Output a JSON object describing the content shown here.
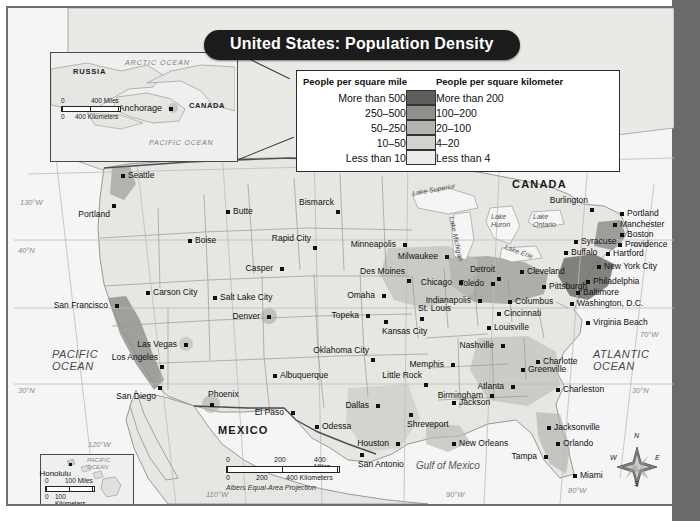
{
  "title": "United States: Population Density",
  "legend": {
    "header_miles": "People per square mile",
    "header_km": "People per square kilometer",
    "rows": [
      {
        "miles": "More than 500",
        "km": "More than 200",
        "color": "#5e5e5b"
      },
      {
        "miles": "250–500",
        "km": "100–200",
        "color": "#8f8f8b"
      },
      {
        "miles": "50–250",
        "km": "20–100",
        "color": "#b2b2ae"
      },
      {
        "miles": "10–50",
        "km": "4–20",
        "color": "#d2d2ce"
      },
      {
        "miles": "Less than 10",
        "km": "Less than 4",
        "color": "#ececea"
      }
    ]
  },
  "insets": {
    "alaska": {
      "labels": [
        "RUSSIA",
        "ARCTIC  OCEAN",
        "CANADA",
        "PACIFIC OCEAN"
      ],
      "city": "Anchorage",
      "scale_miles_0": "0",
      "scale_miles_max": "400 Miles",
      "scale_km_0": "0",
      "scale_km_max": "400 Kilometers"
    },
    "hawaii": {
      "labels": [
        "PACIFIC OCEAN"
      ],
      "city": "Honolulu",
      "scale_miles_0": "0",
      "scale_miles_max": "100 Miles",
      "scale_km_0": "0",
      "scale_km_max": "100 Kilometers"
    }
  },
  "scale": {
    "miles": [
      "0",
      "200",
      "400 Miles"
    ],
    "km": [
      "0",
      "200",
      "400 Kilometers"
    ],
    "projection": "Albers Equal-Area Projection"
  },
  "compass": {
    "n": "N",
    "e": "E",
    "s": "S",
    "w": "W"
  },
  "map_labels": {
    "countries": [
      {
        "name": "CANADA",
        "x": 510,
        "y": 175
      },
      {
        "name": "MEXICO",
        "x": 218,
        "y": 422
      }
    ],
    "oceans": [
      {
        "name": "PACIFIC",
        "sub": "OCEAN",
        "x": 50,
        "y": 348
      },
      {
        "name": "ATLANTIC",
        "sub": "OCEAN",
        "x": 592,
        "y": 348
      },
      {
        "name": "Gulf of Mexico",
        "x": 418,
        "y": 460
      }
    ],
    "lakes": [
      {
        "name": "Lake Superior",
        "x": 420,
        "y": 182
      },
      {
        "name": "Lake Michigan",
        "x": 455,
        "y": 215
      },
      {
        "name": "Lake Huron",
        "x": 493,
        "y": 212
      },
      {
        "name": "Lake Ontario",
        "x": 536,
        "y": 212
      },
      {
        "name": "Lake Erie",
        "x": 508,
        "y": 243
      }
    ],
    "graticules": [
      {
        "name": "130°W",
        "x": 12,
        "y": 190
      },
      {
        "name": "120°W",
        "x": 88,
        "y": 435
      },
      {
        "name": "110°W",
        "x": 203,
        "y": 487
      },
      {
        "name": "90°W",
        "x": 443,
        "y": 490
      },
      {
        "name": "80°W",
        "x": 565,
        "y": 486
      },
      {
        "name": "70°W",
        "x": 643,
        "y": 330
      },
      {
        "name": "40°N",
        "x": 12,
        "y": 243
      },
      {
        "name": "40°N",
        "x": 637,
        "y": 243
      },
      {
        "name": "30°N",
        "x": 14,
        "y": 384
      },
      {
        "name": "30°N",
        "x": 637,
        "y": 384
      }
    ]
  },
  "cities": [
    {
      "name": "Seattle",
      "x": 113,
      "y": 166,
      "pos": "r"
    },
    {
      "name": "Portland",
      "x": 104,
      "y": 196,
      "pos": "bl"
    },
    {
      "name": "Boise",
      "x": 180,
      "y": 231,
      "pos": "r"
    },
    {
      "name": "Butte",
      "x": 218,
      "y": 202,
      "pos": "r"
    },
    {
      "name": "Casper",
      "x": 272,
      "y": 259,
      "pos": "l"
    },
    {
      "name": "Bismarck",
      "x": 328,
      "y": 202,
      "pos": "al"
    },
    {
      "name": "Rapid City",
      "x": 305,
      "y": 238,
      "pos": "al"
    },
    {
      "name": "Minneapolis",
      "x": 395,
      "y": 235,
      "pos": "l"
    },
    {
      "name": "Milwaukee",
      "x": 437,
      "y": 247,
      "pos": "l"
    },
    {
      "name": "Des Moines",
      "x": 399,
      "y": 271,
      "pos": "al"
    },
    {
      "name": "Omaha",
      "x": 374,
      "y": 286,
      "pos": "l"
    },
    {
      "name": "Chicago",
      "x": 451,
      "y": 273,
      "pos": "l"
    },
    {
      "name": "Topeka",
      "x": 358,
      "y": 306,
      "pos": "l"
    },
    {
      "name": "Kansas City",
      "x": 376,
      "y": 312,
      "pos": "b"
    },
    {
      "name": "St. Louis",
      "x": 412,
      "y": 309,
      "pos": "a"
    },
    {
      "name": "Indianapolis",
      "x": 470,
      "y": 291,
      "pos": "l"
    },
    {
      "name": "Detroit",
      "x": 489,
      "y": 269,
      "pos": "al"
    },
    {
      "name": "Toledo",
      "x": 483,
      "y": 274,
      "pos": "l"
    },
    {
      "name": "Columbus",
      "x": 500,
      "y": 292,
      "pos": "r"
    },
    {
      "name": "Cincinnati",
      "x": 489,
      "y": 304,
      "pos": "r"
    },
    {
      "name": "Cleveland",
      "x": 512,
      "y": 262,
      "pos": "r"
    },
    {
      "name": "Louisville",
      "x": 479,
      "y": 318,
      "pos": "r"
    },
    {
      "name": "Pittsburgh",
      "x": 534,
      "y": 277,
      "pos": "r"
    },
    {
      "name": "Buffalo",
      "x": 556,
      "y": 243,
      "pos": "r"
    },
    {
      "name": "Syracuse",
      "x": 566,
      "y": 232,
      "pos": "r"
    },
    {
      "name": "Burlington",
      "x": 582,
      "y": 200,
      "pos": "al"
    },
    {
      "name": "Portland",
      "x": 612,
      "y": 204,
      "pos": "r"
    },
    {
      "name": "Manchester",
      "x": 605,
      "y": 215,
      "pos": "r"
    },
    {
      "name": "Boston",
      "x": 612,
      "y": 225,
      "pos": "r"
    },
    {
      "name": "Providence",
      "x": 610,
      "y": 235,
      "pos": "r"
    },
    {
      "name": "Hartford",
      "x": 598,
      "y": 244,
      "pos": "r"
    },
    {
      "name": "New York City",
      "x": 589,
      "y": 257,
      "pos": "r"
    },
    {
      "name": "Philadelphia",
      "x": 578,
      "y": 272,
      "pos": "r"
    },
    {
      "name": "Baltimore",
      "x": 568,
      "y": 283,
      "pos": "r"
    },
    {
      "name": "Washington, D.C.",
      "x": 562,
      "y": 294,
      "pos": "r"
    },
    {
      "name": "Virginia Beach",
      "x": 578,
      "y": 313,
      "pos": "r"
    },
    {
      "name": "Charlotte",
      "x": 528,
      "y": 352,
      "pos": "r"
    },
    {
      "name": "Greenville",
      "x": 513,
      "y": 360,
      "pos": "r"
    },
    {
      "name": "Nashville",
      "x": 493,
      "y": 336,
      "pos": "l"
    },
    {
      "name": "Memphis",
      "x": 443,
      "y": 355,
      "pos": "l"
    },
    {
      "name": "Atlanta",
      "x": 503,
      "y": 377,
      "pos": "l"
    },
    {
      "name": "Birmingham",
      "x": 482,
      "y": 386,
      "pos": "l"
    },
    {
      "name": "Charleston",
      "x": 548,
      "y": 380,
      "pos": "r"
    },
    {
      "name": "Jackson",
      "x": 444,
      "y": 393,
      "pos": "r"
    },
    {
      "name": "Little Rock",
      "x": 416,
      "y": 375,
      "pos": "al"
    },
    {
      "name": "Shreveport",
      "x": 401,
      "y": 405,
      "pos": "b"
    },
    {
      "name": "Dallas",
      "x": 368,
      "y": 396,
      "pos": "l"
    },
    {
      "name": "Houston",
      "x": 388,
      "y": 434,
      "pos": "l"
    },
    {
      "name": "San Antonio",
      "x": 352,
      "y": 445,
      "pos": "b"
    },
    {
      "name": "New Orleans",
      "x": 444,
      "y": 434,
      "pos": "r"
    },
    {
      "name": "Jacksonville",
      "x": 539,
      "y": 418,
      "pos": "r"
    },
    {
      "name": "Orlando",
      "x": 548,
      "y": 434,
      "pos": "r"
    },
    {
      "name": "Tampa",
      "x": 536,
      "y": 447,
      "pos": "l"
    },
    {
      "name": "Miami",
      "x": 565,
      "y": 466,
      "pos": "r"
    },
    {
      "name": "Odessa",
      "x": 307,
      "y": 417,
      "pos": "r"
    },
    {
      "name": "El Paso",
      "x": 283,
      "y": 403,
      "pos": "l"
    },
    {
      "name": "Albuquerque",
      "x": 265,
      "y": 366,
      "pos": "r"
    },
    {
      "name": "Oklahoma City",
      "x": 363,
      "y": 350,
      "pos": "al"
    },
    {
      "name": "Phoenix",
      "x": 202,
      "y": 395,
      "pos": "a"
    },
    {
      "name": "San Diego",
      "x": 150,
      "y": 378,
      "pos": "bl"
    },
    {
      "name": "Los Angeles",
      "x": 152,
      "y": 357,
      "pos": "al"
    },
    {
      "name": "Las Vegas",
      "x": 176,
      "y": 335,
      "pos": "l"
    },
    {
      "name": "San Francisco",
      "x": 107,
      "y": 296,
      "pos": "l"
    },
    {
      "name": "Carson City",
      "x": 138,
      "y": 283,
      "pos": "r"
    },
    {
      "name": "Salt Lake City",
      "x": 205,
      "y": 288,
      "pos": "r"
    },
    {
      "name": "Denver",
      "x": 259,
      "y": 307,
      "pos": "l"
    }
  ]
}
